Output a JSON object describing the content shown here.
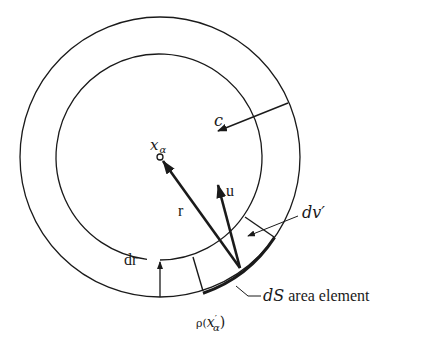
{
  "diagram": {
    "type": "physics-geometry",
    "colors": {
      "stroke": "#1a1a1a",
      "background": "#ffffff"
    },
    "center": {
      "x": 160,
      "y": 157
    },
    "outer_circle_radius": 140,
    "inner_circle_radius": 103
  },
  "labels": {
    "center_point": "x",
    "center_point_sub": "α",
    "radius_vector": "r",
    "velocity_vector": "u",
    "light_speed": "c",
    "shell_thickness": "dr",
    "volume_element": "dv′",
    "area_element_d": "d",
    "area_element_s": "S",
    "area_element_text": " area element",
    "density_rho": "ρ(",
    "density_x": "x",
    "density_sup": "′",
    "density_sub": "α",
    "density_close": ")"
  }
}
